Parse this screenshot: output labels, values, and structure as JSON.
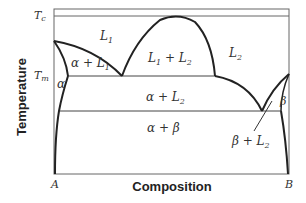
{
  "diagram": {
    "type": "phase-diagram",
    "axes": {
      "xlabel": "Composition",
      "ylabel": "Temperature",
      "x_left": "A",
      "x_right": "B",
      "y_ticks": [
        "Tc",
        "Tm"
      ]
    },
    "regions": {
      "L1": "L1",
      "L2": "L2",
      "L1_L2": "L1 + L2",
      "alpha_L1": "α + L1",
      "alpha": "α",
      "alpha_L2": "α + L2",
      "alpha_beta": "α + β",
      "beta": "β",
      "beta_L2": "β + L2"
    },
    "colors": {
      "line": "#222222",
      "frame": "#555555",
      "text": "#333333"
    }
  }
}
